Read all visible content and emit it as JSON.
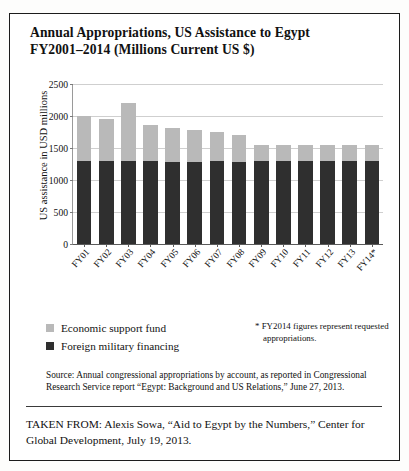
{
  "scan": {
    "top_edge_artifact": ""
  },
  "figure": {
    "title_line1": "Annual Appropriations, US Assistance to Egypt",
    "title_line2": "FY2001–2014 (Millions Current US $)",
    "legend": [
      {
        "key": "esf",
        "label": "Economic support fund",
        "color": "#b9b9b9"
      },
      {
        "key": "fmf",
        "label": "Foreign military financing",
        "color": "#2f2f2f"
      }
    ],
    "footnote_line1": "* FY2014 figures represent requested",
    "footnote_line2": "appropriations.",
    "source_line1": "Source: Annual congressional appropriations by account, as reported in",
    "source_line2": "Congressional Research Service report “Egypt: Background and US Relations,”",
    "source_line3": "June 27, 2013.",
    "taken_from_line1": "TAKEN FROM: Alexis Sowa, “Aid to Egypt by the Numbers,” Center",
    "taken_from_line2": "for Global Development, July 19, 2013."
  },
  "chart_data": {
    "type": "bar",
    "stacked": true,
    "title": "Annual Appropriations, US Assistance to Egypt FY2001–2014 (Millions Current US $)",
    "xlabel": "",
    "ylabel": "US assistance in USD millions",
    "ylim": [
      0,
      2500
    ],
    "yticks": [
      0,
      500,
      1000,
      1500,
      2000,
      2500
    ],
    "ytick_labels": [
      "0",
      "500",
      "1000",
      "1500",
      "2000",
      "2500"
    ],
    "grid": true,
    "grid_axis": "y",
    "legend_position": "below-left",
    "categories": [
      "FY01",
      "FY02",
      "FY03",
      "FY04",
      "FY05",
      "FY06",
      "FY07",
      "FY08",
      "FY09",
      "FY10",
      "FY11",
      "FY12",
      "FY13",
      "FY14*"
    ],
    "series": [
      {
        "name": "Foreign military financing",
        "color": "#2f2f2f",
        "values": [
          1300,
          1300,
          1300,
          1292,
          1289,
          1287,
          1300,
          1289,
          1300,
          1300,
          1300,
          1300,
          1300,
          1300
        ]
      },
      {
        "name": "Economic support fund",
        "color": "#b9b9b9",
        "values": [
          700,
          655,
          911,
          572,
          530,
          490,
          450,
          415,
          250,
          250,
          250,
          250,
          250,
          250
        ]
      }
    ],
    "totals": [
      2000,
      1955,
      2211,
      1864,
      1819,
      1777,
      1750,
      1704,
      1550,
      1550,
      1550,
      1550,
      1550,
      1550
    ],
    "annotations": [
      "* FY2014 figures represent requested appropriations."
    ]
  }
}
